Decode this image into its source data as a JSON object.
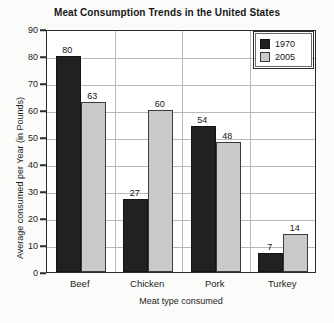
{
  "chart_data": {
    "type": "bar",
    "title": "Meat Consumption Trends in the United States",
    "xlabel": "Meat type consumed",
    "ylabel": "Average consumed per Year (in Pounds)",
    "categories": [
      "Beef",
      "Chicken",
      "Pork",
      "Turkey"
    ],
    "series": [
      {
        "name": "1970",
        "color": "#212121",
        "values": [
          80,
          27,
          54,
          7
        ]
      },
      {
        "name": "2005",
        "color": "#c9c9c9",
        "values": [
          63,
          60,
          48,
          14
        ]
      }
    ],
    "ylim": [
      0,
      90
    ],
    "yticks": [
      0,
      10,
      20,
      30,
      40,
      50,
      60,
      70,
      80,
      90
    ],
    "ytick_labels": [
      "0",
      "10",
      "20",
      "30",
      "40",
      "50",
      "60",
      "70",
      "80",
      "90"
    ],
    "grid": true,
    "legend_position": "top-right",
    "data_labels": true
  }
}
